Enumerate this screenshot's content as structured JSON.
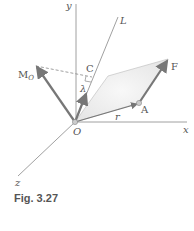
{
  "figure": {
    "caption": "Fig. 3.27",
    "labels": {
      "y_axis": "y",
      "x_axis": "x",
      "z_axis": "z",
      "line_L": "L",
      "point_C": "C",
      "unit_vector": "λ",
      "moment_M": "M",
      "moment_sub": "O",
      "force": "F",
      "point_A": "A",
      "position_vector": "r",
      "origin": "O"
    },
    "colors": {
      "vector": "#777777",
      "axis": "#888888",
      "plane": "#ececec"
    }
  }
}
